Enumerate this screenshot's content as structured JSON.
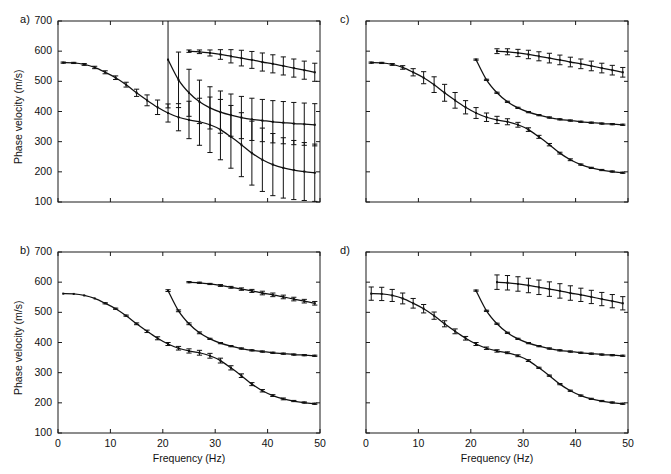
{
  "figure": {
    "panels": [
      "a)",
      "b)",
      "c)",
      "d)"
    ],
    "axis": {
      "xlabel": "Frequency (Hz)",
      "ylabel": "Phase velocity (m/s)",
      "xticks": [
        "0",
        "10",
        "20",
        "30",
        "40",
        "50"
      ],
      "yticks": [
        "100",
        "200",
        "300",
        "400",
        "500",
        "600",
        "700"
      ],
      "xlim": [
        0,
        50
      ],
      "ylim": [
        100,
        700
      ]
    }
  },
  "chart_data": [
    {
      "type": "line",
      "panel": "a)",
      "title": "",
      "xlabel": "Frequency (Hz)",
      "ylabel": "Phase velocity (m/s)",
      "xlim": [
        0,
        50
      ],
      "ylim": [
        100,
        700
      ],
      "grid": false,
      "legend": "none",
      "errorbars": "large",
      "series": [
        {
          "name": "fundamental-mode",
          "x": [
            1,
            3,
            5,
            7,
            9,
            11,
            13,
            15,
            17,
            19,
            21,
            23,
            25,
            27,
            29,
            31,
            33,
            35,
            37,
            39,
            41,
            43,
            45,
            47,
            49
          ],
          "y": [
            562,
            561,
            556,
            546,
            530,
            512,
            489,
            462,
            437,
            414,
            395,
            381,
            372,
            366,
            356,
            340,
            316,
            290,
            262,
            240,
            224,
            213,
            206,
            201,
            197
          ],
          "yerr": [
            2,
            2,
            3,
            4,
            5,
            6,
            8,
            12,
            18,
            24,
            30,
            45,
            62,
            78,
            92,
            100,
            104,
            106,
            106,
            105,
            103,
            100,
            98,
            96,
            95
          ]
        },
        {
          "name": "first-higher-mode",
          "x": [
            21,
            23,
            25,
            27,
            29,
            31,
            33,
            35,
            37,
            39,
            41,
            43,
            45,
            47,
            49
          ],
          "y": [
            572,
            505,
            462,
            432,
            412,
            398,
            388,
            380,
            374,
            370,
            366,
            363,
            360,
            358,
            356
          ],
          "yerr": [
            160,
            92,
            78,
            72,
            70,
            70,
            70,
            70,
            70,
            70,
            70,
            70,
            70,
            70,
            70
          ]
        },
        {
          "name": "second-higher-mode",
          "x": [
            25,
            27,
            29,
            31,
            33,
            35,
            37,
            39,
            41,
            43,
            45,
            47,
            49
          ],
          "y": [
            600,
            598,
            594,
            589,
            583,
            577,
            571,
            564,
            558,
            551,
            544,
            537,
            530
          ],
          "yerr": [
            4,
            6,
            10,
            16,
            22,
            26,
            28,
            30,
            30,
            30,
            30,
            30,
            30
          ]
        }
      ]
    },
    {
      "type": "line",
      "panel": "b)",
      "title": "",
      "xlabel": "Frequency (Hz)",
      "ylabel": "Phase velocity (m/s)",
      "xlim": [
        0,
        50
      ],
      "ylim": [
        100,
        700
      ],
      "grid": false,
      "legend": "none",
      "errorbars": "very-small",
      "series": [
        {
          "name": "fundamental-mode",
          "x": [
            1,
            3,
            5,
            7,
            9,
            11,
            13,
            15,
            17,
            19,
            21,
            23,
            25,
            27,
            29,
            31,
            33,
            35,
            37,
            39,
            41,
            43,
            45,
            47,
            49
          ],
          "y": [
            562,
            561,
            556,
            546,
            530,
            512,
            489,
            462,
            437,
            414,
            395,
            381,
            372,
            366,
            356,
            340,
            316,
            290,
            262,
            240,
            224,
            213,
            206,
            201,
            197
          ],
          "yerr": [
            1,
            1,
            1,
            1,
            2,
            2,
            2,
            3,
            4,
            5,
            5,
            6,
            7,
            8,
            8,
            8,
            7,
            6,
            5,
            4,
            3,
            3,
            2,
            2,
            2
          ]
        },
        {
          "name": "first-higher-mode",
          "x": [
            21,
            23,
            25,
            27,
            29,
            31,
            33,
            35,
            37,
            39,
            41,
            43,
            45,
            47,
            49
          ],
          "y": [
            572,
            505,
            462,
            432,
            412,
            398,
            388,
            380,
            374,
            370,
            366,
            363,
            360,
            358,
            356
          ],
          "yerr": [
            3,
            3,
            3,
            3,
            2,
            2,
            2,
            2,
            2,
            2,
            2,
            2,
            2,
            2,
            2
          ]
        },
        {
          "name": "second-higher-mode",
          "x": [
            25,
            27,
            29,
            31,
            33,
            35,
            37,
            39,
            41,
            43,
            45,
            47,
            49
          ],
          "y": [
            600,
            598,
            594,
            589,
            583,
            577,
            571,
            564,
            558,
            551,
            544,
            537,
            530
          ],
          "yerr": [
            2,
            2,
            2,
            3,
            3,
            4,
            5,
            6,
            6,
            6,
            6,
            6,
            6
          ]
        }
      ]
    },
    {
      "type": "line",
      "panel": "c)",
      "title": "",
      "xlabel": "Frequency (Hz)",
      "ylabel": "Phase velocity (m/s)",
      "xlim": [
        0,
        50
      ],
      "ylim": [
        100,
        700
      ],
      "grid": false,
      "legend": "none",
      "errorbars": "moderate",
      "series": [
        {
          "name": "fundamental-mode",
          "x": [
            1,
            3,
            5,
            7,
            9,
            11,
            13,
            15,
            17,
            19,
            21,
            23,
            25,
            27,
            29,
            31,
            33,
            35,
            37,
            39,
            41,
            43,
            45,
            47,
            49
          ],
          "y": [
            562,
            561,
            556,
            546,
            530,
            512,
            489,
            462,
            437,
            414,
            395,
            381,
            372,
            366,
            356,
            340,
            316,
            290,
            262,
            240,
            224,
            213,
            206,
            201,
            197
          ],
          "yerr": [
            2,
            2,
            3,
            6,
            12,
            20,
            26,
            28,
            26,
            22,
            18,
            14,
            12,
            10,
            8,
            6,
            5,
            4,
            3,
            3,
            2,
            2,
            2,
            2,
            2
          ]
        },
        {
          "name": "first-higher-mode",
          "x": [
            21,
            23,
            25,
            27,
            29,
            31,
            33,
            35,
            37,
            39,
            41,
            43,
            45,
            47,
            49
          ],
          "y": [
            572,
            505,
            462,
            432,
            412,
            398,
            388,
            380,
            374,
            370,
            366,
            363,
            360,
            358,
            356
          ],
          "yerr": [
            2,
            2,
            2,
            2,
            2,
            2,
            2,
            2,
            2,
            2,
            2,
            2,
            2,
            2,
            2
          ]
        },
        {
          "name": "second-higher-mode",
          "x": [
            25,
            27,
            29,
            31,
            33,
            35,
            37,
            39,
            41,
            43,
            45,
            47,
            49
          ],
          "y": [
            600,
            598,
            594,
            589,
            583,
            577,
            571,
            564,
            558,
            551,
            544,
            537,
            530
          ],
          "yerr": [
            8,
            10,
            12,
            14,
            15,
            16,
            16,
            16,
            16,
            16,
            16,
            16,
            16
          ]
        }
      ]
    },
    {
      "type": "line",
      "panel": "d)",
      "title": "",
      "xlabel": "Frequency (Hz)",
      "ylabel": "Phase velocity (m/s)",
      "xlim": [
        0,
        50
      ],
      "ylim": [
        100,
        700
      ],
      "grid": false,
      "legend": "none",
      "errorbars": "moderate-low-frequency",
      "series": [
        {
          "name": "fundamental-mode",
          "x": [
            1,
            3,
            5,
            7,
            9,
            11,
            13,
            15,
            17,
            19,
            21,
            23,
            25,
            27,
            29,
            31,
            33,
            35,
            37,
            39,
            41,
            43,
            45,
            47,
            49
          ],
          "y": [
            562,
            561,
            556,
            546,
            530,
            512,
            489,
            462,
            437,
            414,
            395,
            381,
            372,
            366,
            356,
            340,
            316,
            290,
            262,
            240,
            224,
            213,
            206,
            201,
            197
          ],
          "yerr": [
            22,
            22,
            20,
            18,
            16,
            14,
            12,
            10,
            8,
            6,
            5,
            4,
            4,
            3,
            3,
            3,
            2,
            2,
            2,
            2,
            2,
            2,
            2,
            2,
            2
          ]
        },
        {
          "name": "first-higher-mode",
          "x": [
            21,
            23,
            25,
            27,
            29,
            31,
            33,
            35,
            37,
            39,
            41,
            43,
            45,
            47,
            49
          ],
          "y": [
            572,
            505,
            462,
            432,
            412,
            398,
            388,
            380,
            374,
            370,
            366,
            363,
            360,
            358,
            356
          ],
          "yerr": [
            2,
            2,
            2,
            2,
            2,
            2,
            2,
            2,
            2,
            2,
            2,
            2,
            2,
            2,
            2
          ]
        },
        {
          "name": "second-higher-mode",
          "x": [
            25,
            27,
            29,
            31,
            33,
            35,
            37,
            39,
            41,
            43,
            45,
            47,
            49
          ],
          "y": [
            600,
            598,
            594,
            589,
            583,
            577,
            571,
            564,
            558,
            551,
            544,
            537,
            530
          ],
          "yerr": [
            24,
            24,
            24,
            24,
            24,
            24,
            24,
            24,
            22,
            22,
            22,
            22,
            22
          ]
        }
      ]
    }
  ]
}
